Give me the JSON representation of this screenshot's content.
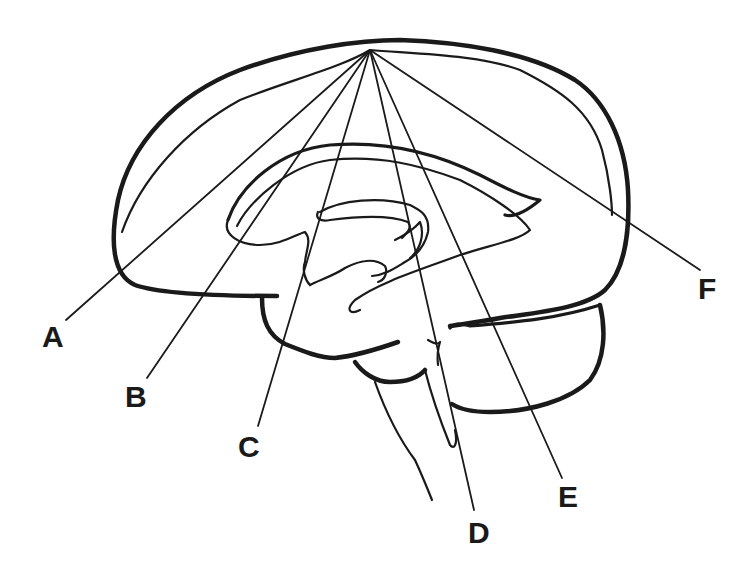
{
  "diagram": {
    "convergence_point": [
      370,
      50
    ],
    "labels": [
      {
        "id": "A",
        "text": "A",
        "x": 42,
        "y": 322,
        "line_end": [
          66,
          320
        ]
      },
      {
        "id": "B",
        "text": "B",
        "x": 125,
        "y": 382,
        "line_end": [
          147,
          378
        ]
      },
      {
        "id": "C",
        "text": "C",
        "x": 238,
        "y": 432,
        "line_end": [
          258,
          426
        ]
      },
      {
        "id": "D",
        "text": "D",
        "x": 470,
        "y": 518,
        "line_end": [
          474,
          510
        ]
      },
      {
        "id": "E",
        "text": "E",
        "x": 560,
        "y": 482,
        "line_end": [
          562,
          478
        ]
      },
      {
        "id": "F",
        "text": "F",
        "x": 700,
        "y": 274,
        "line_end": [
          700,
          270
        ]
      }
    ],
    "colors": {
      "line": "#1a1a1a",
      "background": "#ffffff"
    }
  }
}
